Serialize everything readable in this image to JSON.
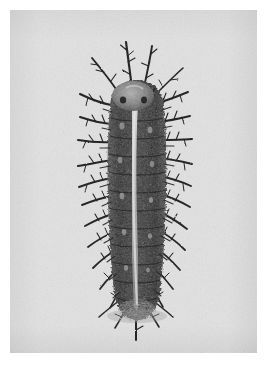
{
  "page": {
    "width": 269,
    "height": 365,
    "background_color": "#ffffff",
    "media_type": "photograph",
    "color_mode": "black-and-white",
    "caption": ""
  },
  "photo": {
    "left": 10,
    "top": 10,
    "width": 247,
    "height": 343,
    "background_color": "#e4e4e4",
    "grain": "film-grain",
    "subject_name": "spiny caterpillar",
    "subject_description": "Dorsal view of a dark, densely spined caterpillar (larva) with branched scoli along the body and a pale stripe down the middle of the back, photographed against a plain light background.",
    "orientation": "vertical, head at top, tail at bottom"
  },
  "subject": {
    "body": {
      "center_x": 137,
      "top_y": 82,
      "bottom_y": 318,
      "half_width": 25,
      "fill_dark": "#2f2f2f",
      "fill_mid": "#4c4c4c",
      "fill_light": "#8c8c8c"
    },
    "dorsal_stripe": {
      "color": "#d8d8d8",
      "label": "pale dorsal stripe",
      "width": 5
    },
    "head": {
      "center_x": 133,
      "center_y": 96,
      "radius_x": 21,
      "radius_y": 15,
      "color": "#707070",
      "label": "head capsule"
    },
    "spines": {
      "color": "#262626",
      "label": "branched spines (scoli)",
      "rows": 13,
      "longest_px": 48
    },
    "colors": {
      "darkest": "#1c1c1c",
      "body_dark": "#333333",
      "body_mid": "#555555",
      "highlight": "#d5d5d5",
      "background": "#e4e4e4",
      "paper": "#ffffff"
    }
  }
}
